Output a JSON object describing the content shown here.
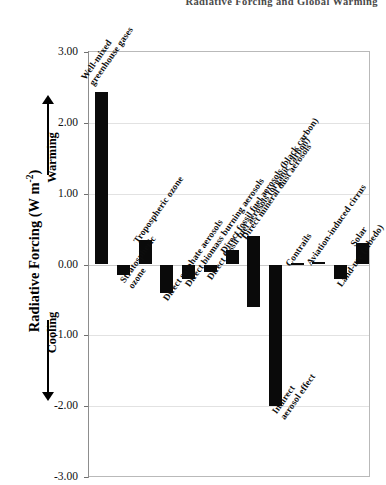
{
  "running_header": "Radiative  Forcing  and  Global  Warming",
  "axis": {
    "y_title_main": "Radiative Forcing (W m",
    "y_title_exp": "-2",
    "y_title_close": ")",
    "warming_label": "Warming",
    "cooling_label": "Cooling",
    "ticks": [
      "3.00",
      "2.00",
      "1.00",
      "0.00",
      "-1.00",
      "-2.00",
      "-3.00"
    ]
  },
  "chart_data": {
    "type": "bar",
    "title": "",
    "xlabel": "",
    "ylabel": "Radiative Forcing (W m-2)",
    "ylim": [
      -3.0,
      3.0
    ],
    "yticks": [
      3.0,
      2.0,
      1.0,
      0.0,
      -1.0,
      -2.0,
      -3.0
    ],
    "grid": true,
    "legend": "none",
    "orientation": "vertical",
    "bar_color": "#0a0a0a",
    "categories": [
      "Well-mixed greenhouse gases",
      "Stratospheric ozone",
      "Tropospheric ozone",
      "Direct sulphate aerosols",
      "Direct biomass burning aerosols",
      "Direct fossil fuel aerosols (organic carbon)",
      "Direct fossil fuel aerosols (black carbon)",
      "Direct mineral dust aerosols",
      "Indirect aerosol effect",
      "Contrails",
      "Aviation-induced cirrus",
      "Land-use (albedo)",
      "Solar"
    ],
    "values": [
      2.43,
      -0.15,
      0.35,
      -0.4,
      -0.2,
      -0.1,
      0.2,
      null,
      -2.0,
      0.02,
      0.03,
      -0.2,
      0.3
    ],
    "ranges": [
      null,
      null,
      null,
      null,
      null,
      null,
      null,
      {
        "low": -0.6,
        "high": 0.4
      },
      null,
      null,
      null,
      null,
      null
    ]
  },
  "bars": [
    {
      "label_line1": "Well-mixed",
      "label_line2": "greenhouse gases",
      "value": 2.43
    },
    {
      "label_line1": "Stratospheric",
      "label_line2": "ozone",
      "value": -0.15
    },
    {
      "label_line1": "Tropospheric ozone",
      "label_line2": "",
      "value": 0.35
    },
    {
      "label_line1": "Direct sulphate aerosols",
      "label_line2": "",
      "value": -0.4
    },
    {
      "label_line1": "Direct biomass burning aerosols",
      "label_line2": "",
      "value": -0.2
    },
    {
      "label_line1": "Direct fossil fuel aerosols (organic carbon)",
      "label_line2": "",
      "value": -0.1
    },
    {
      "label_line1": "Direct fossil fuel aerosols (black carbon)",
      "label_line2": "",
      "value": 0.2
    },
    {
      "label_line1": "Direct mineral dust aerosols",
      "label_line2": "",
      "value": 0.4
    },
    {
      "label_line1": "Indirect",
      "label_line2": "aerosol effect",
      "value": -2.0
    },
    {
      "label_line1": "Contrails",
      "label_line2": "",
      "value": 0.02
    },
    {
      "label_line1": "Aviation-induced cirrus",
      "label_line2": "",
      "value": 0.03
    },
    {
      "label_line1": "Land-use (albedo)",
      "label_line2": "",
      "value": -0.2
    },
    {
      "label_line1": "Solar",
      "label_line2": "",
      "value": 0.3
    }
  ]
}
